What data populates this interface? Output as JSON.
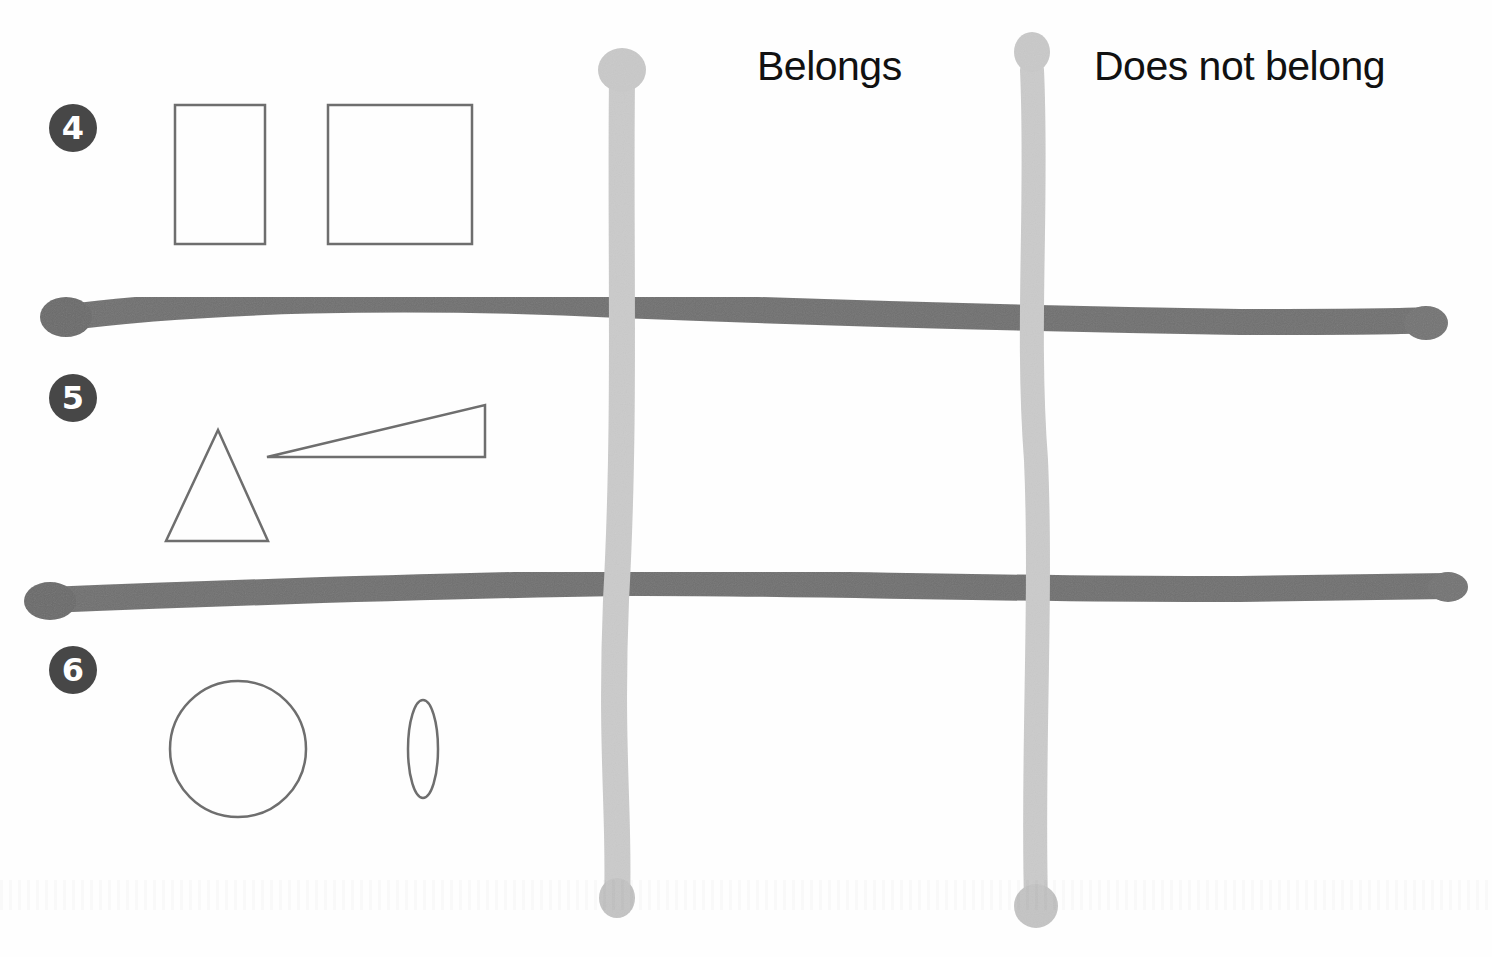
{
  "columns": {
    "belongs": "Belongs",
    "does_not_belong": "Does not belong"
  },
  "rows": [
    {
      "number": "4",
      "shapes": [
        "tall-rectangle",
        "square"
      ]
    },
    {
      "number": "5",
      "shapes": [
        "isosceles-triangle",
        "right-triangle"
      ]
    },
    {
      "number": "6",
      "shapes": [
        "circle",
        "narrow-ellipse"
      ]
    }
  ],
  "colors": {
    "badge": "#474747",
    "shape_outline": "#6e6e6e",
    "horizontal_stick": "#6f6f6f",
    "vertical_stick": "#c9c9c9",
    "header_text": "#111111"
  }
}
